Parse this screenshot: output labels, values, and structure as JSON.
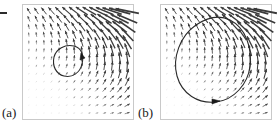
{
  "figure": {
    "title": "",
    "caption": "",
    "background_color": "#ffffff",
    "frame_color": "#c9c9c9",
    "arrow_color": "#3a3a3a",
    "orbit_color": "#2a2a2a"
  },
  "panels": [
    {
      "id": "a",
      "label": "(a)",
      "label_x": 2,
      "label_y": 108,
      "frame": {
        "x": 22,
        "y": 4,
        "width": 112,
        "height": 116
      }
    },
    {
      "id": "b",
      "label": "(b)",
      "label_x": 138,
      "label_y": 108,
      "frame": {
        "x": 160,
        "y": 4,
        "width": 112,
        "height": 116
      }
    }
  ],
  "axis_marks": [
    {
      "name": "y-axis-tick",
      "x": 0,
      "y": 12,
      "width": 7,
      "height": 2
    }
  ],
  "chart_data": {
    "type": "scatter",
    "subtype": "vector-field-phase-portrait",
    "title": "",
    "xlabel": "",
    "ylabel": "",
    "xlim": [
      0,
      1
    ],
    "ylim": [
      0,
      1
    ],
    "grid": false,
    "legend": null,
    "annotations": [
      "(a)",
      "(b)"
    ],
    "grid_nx": 14,
    "grid_ny": 14,
    "series": [
      {
        "name": "direction-field-a",
        "panel": "a",
        "type": "quiver",
        "description": "Vectors rotate from rightward along the bottom edge to up-left in the upper-right corner; magnitudes near zero in the lower-left and maximal in the upper-right."
      },
      {
        "name": "limit-cycle-a",
        "panel": "a",
        "type": "closed-orbit",
        "center": [
          0.33,
          0.38
        ],
        "radius_x": 0.145,
        "radius_y": 0.155,
        "direction": "clockwise",
        "arrowhead_at": [
          0.47,
          0.4
        ]
      },
      {
        "name": "direction-field-b",
        "panel": "b",
        "type": "quiver",
        "description": "Same field geometry as panel (a): small rightward arrows along the bottom, large up-left arrows in the upper-right corner."
      },
      {
        "name": "limit-cycle-b",
        "panel": "b",
        "type": "closed-orbit",
        "center": [
          0.47,
          0.55
        ],
        "radius_x": 0.37,
        "radius_y": 0.38,
        "shape": "egg",
        "direction": "clockwise",
        "arrowhead_at": [
          0.52,
          0.16
        ]
      }
    ]
  }
}
